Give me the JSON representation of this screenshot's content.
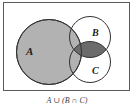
{
  "diagram": {
    "type": "venn",
    "caption": "A ∪ (B ∩ C)",
    "sets": {
      "a": {
        "label": "A",
        "shaded": true
      },
      "b": {
        "label": "B",
        "shaded": false
      },
      "c": {
        "label": "C",
        "shaded": false
      }
    },
    "shaded_regions": [
      "A",
      "B ∩ C"
    ],
    "colors": {
      "background": "#ffffff",
      "frame_border": "#5a5a5a",
      "set_a_fill": "#b2b2b2",
      "intersection_fill": "#6b6b6b",
      "circle_outline": "#333333",
      "label_color": "#1d1d1d",
      "caption_color": "#3f3f3f"
    }
  }
}
